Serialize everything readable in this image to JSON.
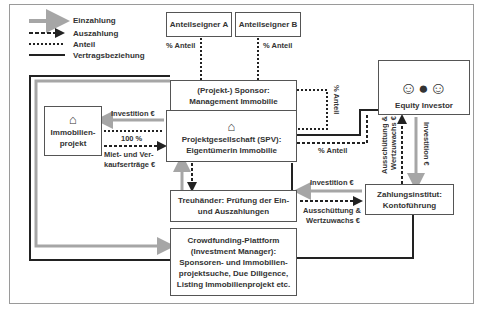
{
  "legend": {
    "items": [
      {
        "label": "Einzahlung",
        "style": "gray-thick-arrow"
      },
      {
        "label": "Auszahlung",
        "style": "dashed-arrow"
      },
      {
        "label": "Anteil",
        "style": "dotted"
      },
      {
        "label": "Vertragsbeziehung",
        "style": "solid"
      }
    ]
  },
  "nodes": {
    "anteilseigner_a": "Anteilseigner A",
    "anteilseigner_b": "Anteilseigner B",
    "sponsor": [
      "(Projekt-) Sponsor:",
      "Management Immobilie"
    ],
    "spv": [
      "Projektgesellschaft (SPV):",
      "Eigentümerin Immobilie"
    ],
    "immobilienprojekt": [
      "Immobilien-",
      "projekt"
    ],
    "equity_investor": "Equity Investor",
    "treuhaender": [
      "Treuhänder: Prüfung der Ein-",
      "und Auszahlungen"
    ],
    "zahlungsinstitut": [
      "Zahlungsinstitut:",
      "Kontoführung"
    ],
    "crowdfunding": [
      "Crowdfunding-Plattform",
      "(Investment Manager):",
      "Sponsoren- und Immobilien-",
      "projektsuche, Due Diligence,",
      "Listing Immobilienprojekt etc."
    ]
  },
  "edge_labels": {
    "anteil_a": "% Anteil",
    "anteil_b": "% Anteil",
    "investition_immo": "Investition €",
    "hundert_prozent": "100 %",
    "miet_1": "Miet- und Ver-",
    "miet_2": "kaufserträge €",
    "anteil_sponsor": "% Anteil",
    "anteil_spv": "% Anteil",
    "ausschuettung_investor_1": "Ausschüttung &",
    "ausschuettung_investor_2": "Wertzuwachs €",
    "investition_investor": "Investition €",
    "investition_treuhaender": "Investition €",
    "ausschuettung_treuhaender_1": "Ausschüttung &",
    "ausschuettung_treuhaender_2": "Wertzuwachs €"
  },
  "colors": {
    "einzahlung": "#a6a6a6",
    "line": "#222222",
    "box_border": "#555555"
  }
}
